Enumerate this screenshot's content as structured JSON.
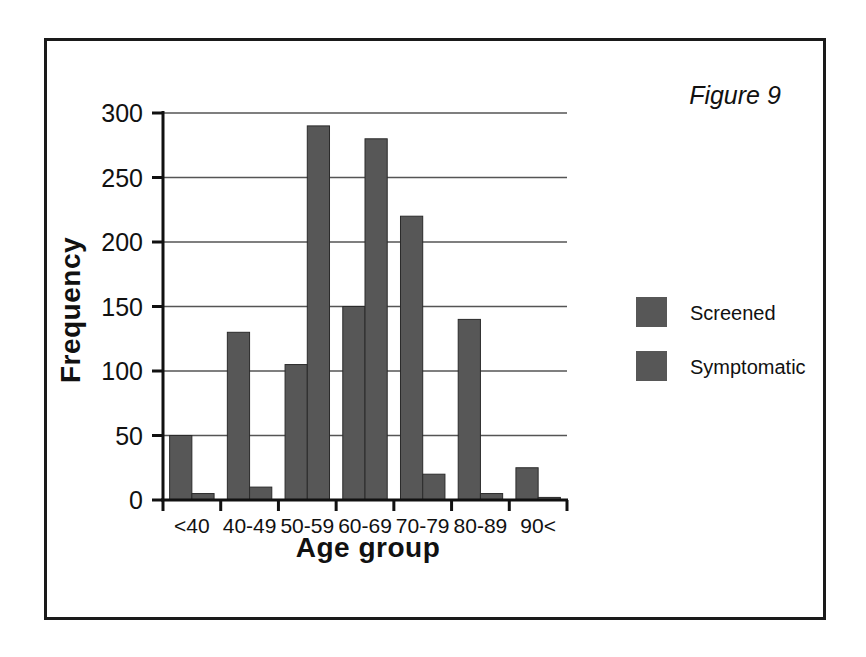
{
  "figure": {
    "caption": "Figure 9"
  },
  "legend": {
    "position": "right",
    "entries": [
      {
        "label": "Screened",
        "color": "#575757"
      },
      {
        "label": "Symptomatic",
        "color": "#575757"
      }
    ]
  },
  "colors": {
    "bar": "#575757",
    "axis": "#111111",
    "grid": "#555555",
    "frame": "#1a1a1a",
    "background": "#ffffff"
  },
  "chart_data": {
    "type": "bar",
    "title": "",
    "xlabel": "Age group",
    "ylabel": "Frequency",
    "categories": [
      "<40",
      "40-49",
      "50-59",
      "60-69",
      "70-79",
      "80-89",
      "90<"
    ],
    "series": [
      {
        "name": "Screened",
        "values": [
          50,
          130,
          105,
          150,
          220,
          140,
          25
        ]
      },
      {
        "name": "Symptomatic",
        "values": [
          5,
          10,
          290,
          280,
          20,
          5,
          2
        ]
      }
    ],
    "yticks": [
      0,
      50,
      100,
      150,
      200,
      250,
      300
    ],
    "ylim": [
      0,
      300
    ],
    "grid": true,
    "legend_position": "right"
  }
}
